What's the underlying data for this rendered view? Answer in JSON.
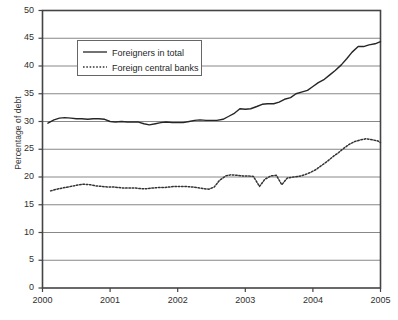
{
  "chart_data": {
    "type": "line",
    "title": "",
    "xlabel": "",
    "ylabel": "Percentage of debt",
    "xlim": [
      2000,
      2005
    ],
    "ylim": [
      0,
      50
    ],
    "ytick_labels": [
      "0",
      "5",
      "10",
      "15",
      "20",
      "25",
      "30",
      "35",
      "40",
      "45",
      "50"
    ],
    "yticks": [
      0,
      5,
      10,
      15,
      20,
      25,
      30,
      35,
      40,
      45,
      50
    ],
    "xtick_labels": [
      "2000",
      "2001",
      "2002",
      "2003",
      "2004",
      "2005"
    ],
    "xticks": [
      2000,
      2001,
      2002,
      2003,
      2004,
      2005
    ],
    "grid": "horizontal",
    "legend_position": "upper-left-inside",
    "legend_entries": [
      "Foreigners in total",
      "Foreign central banks"
    ],
    "series": [
      {
        "name": "Foreigners in total",
        "style": "solid",
        "color": "#262626",
        "x": [
          2000.08,
          2000.17,
          2000.25,
          2000.33,
          2000.42,
          2000.5,
          2000.58,
          2000.67,
          2000.75,
          2000.83,
          2000.92,
          2001.0,
          2001.08,
          2001.17,
          2001.25,
          2001.33,
          2001.42,
          2001.5,
          2001.58,
          2001.67,
          2001.75,
          2001.83,
          2001.92,
          2002.0,
          2002.08,
          2002.17,
          2002.25,
          2002.33,
          2002.42,
          2002.5,
          2002.58,
          2002.67,
          2002.75,
          2002.83,
          2002.92,
          2003.0,
          2003.08,
          2003.17,
          2003.25,
          2003.33,
          2003.42,
          2003.5,
          2003.58,
          2003.67,
          2003.75,
          2003.83,
          2003.92,
          2004.0,
          2004.08,
          2004.17,
          2004.25,
          2004.33,
          2004.42,
          2004.5,
          2004.58,
          2004.67,
          2004.75,
          2004.83,
          2004.92,
          2005.0
        ],
        "values": [
          29.7,
          30.3,
          30.6,
          30.7,
          30.6,
          30.5,
          30.5,
          30.4,
          30.5,
          30.5,
          30.4,
          30.0,
          29.9,
          30.0,
          29.9,
          29.9,
          29.9,
          29.6,
          29.4,
          29.6,
          29.8,
          29.9,
          29.8,
          29.8,
          29.8,
          30.0,
          30.2,
          30.3,
          30.2,
          30.2,
          30.2,
          30.4,
          30.9,
          31.4,
          32.3,
          32.2,
          32.3,
          32.7,
          33.1,
          33.2,
          33.2,
          33.5,
          34.0,
          34.3,
          35.0,
          35.3,
          35.6,
          36.3,
          37.0,
          37.6,
          38.4,
          39.2,
          40.2,
          41.3,
          42.5,
          43.5,
          43.5,
          43.8,
          44.0,
          44.4
        ]
      },
      {
        "name": "Foreign central banks",
        "style": "dotted",
        "color": "#333333",
        "x": [
          2000.12,
          2000.21,
          2000.29,
          2000.38,
          2000.46,
          2000.54,
          2000.62,
          2000.71,
          2000.79,
          2000.88,
          2000.96,
          2001.04,
          2001.12,
          2001.21,
          2001.29,
          2001.38,
          2001.46,
          2001.54,
          2001.62,
          2001.71,
          2001.79,
          2001.88,
          2001.96,
          2002.04,
          2002.12,
          2002.21,
          2002.29,
          2002.38,
          2002.46,
          2002.54,
          2002.62,
          2002.71,
          2002.79,
          2002.88,
          2002.96,
          2003.04,
          2003.12,
          2003.21,
          2003.29,
          2003.38,
          2003.46,
          2003.54,
          2003.62,
          2003.71,
          2003.79,
          2003.88,
          2003.96,
          2004.04,
          2004.12,
          2004.21,
          2004.29,
          2004.38,
          2004.46,
          2004.54,
          2004.62,
          2004.71,
          2004.79,
          2004.88,
          2004.96,
          2005.0
        ],
        "values": [
          17.5,
          17.8,
          18.0,
          18.2,
          18.4,
          18.6,
          18.7,
          18.6,
          18.4,
          18.3,
          18.2,
          18.2,
          18.1,
          18.0,
          18.0,
          18.0,
          17.9,
          17.9,
          18.0,
          18.1,
          18.1,
          18.2,
          18.3,
          18.3,
          18.3,
          18.2,
          18.1,
          17.9,
          17.8,
          18.2,
          19.4,
          20.2,
          20.4,
          20.3,
          20.2,
          20.2,
          20.1,
          18.3,
          19.6,
          20.2,
          20.3,
          18.6,
          19.8,
          20.0,
          20.1,
          20.4,
          20.8,
          21.3,
          22.0,
          22.8,
          23.6,
          24.4,
          25.2,
          25.9,
          26.4,
          26.7,
          26.9,
          26.7,
          26.5,
          26.2
        ]
      }
    ]
  },
  "axis": {
    "ylabel_text": "Percentage of debt"
  },
  "colors": {
    "frame": "#444444",
    "gridline": "#7a7a7a",
    "background": "#ffffff",
    "tick_text": "#2f2f2f"
  }
}
